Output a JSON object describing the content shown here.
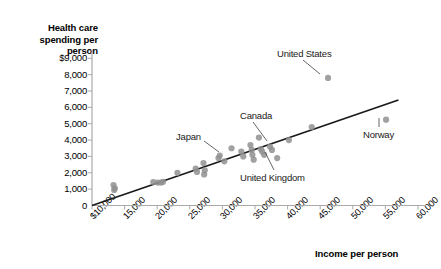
{
  "chart_data": {
    "type": "scatter",
    "title": "",
    "ylabel": "Health care spending per person",
    "xlabel": "Income per person",
    "xlim": [
      10000,
      60000
    ],
    "ylim": [
      0,
      9000
    ],
    "grid": false,
    "legend": null,
    "xticks": [
      "$10,000",
      "15,000",
      "20,000",
      "25,000",
      "30,000",
      "35,000",
      "40,000",
      "45,000",
      "50,000",
      "55,000",
      "60,000"
    ],
    "xtick_values": [
      10000,
      15000,
      20000,
      25000,
      30000,
      35000,
      40000,
      45000,
      50000,
      55000,
      60000
    ],
    "yticks": [
      "0",
      "1,000",
      "2,000",
      "3,000",
      "4,000",
      "5,000",
      "6,000",
      "7,000",
      "8,000",
      "$9,000"
    ],
    "ytick_values": [
      0,
      1000,
      2000,
      3000,
      4000,
      5000,
      6000,
      7000,
      8000,
      9000
    ],
    "marker_color": "#909090",
    "line_color": "#1a1a1a",
    "axis_color": "#aaaaaa",
    "trendline": {
      "x": [
        10000,
        57000
      ],
      "y": [
        0,
        6450
      ]
    },
    "points": [
      {
        "x": 13300,
        "y": 1250
      },
      {
        "x": 13400,
        "y": 950
      },
      {
        "x": 13500,
        "y": 1050
      },
      {
        "x": 19400,
        "y": 1430
      },
      {
        "x": 20100,
        "y": 1400
      },
      {
        "x": 20600,
        "y": 1400
      },
      {
        "x": 20900,
        "y": 1450
      },
      {
        "x": 23100,
        "y": 2000
      },
      {
        "x": 25900,
        "y": 2250
      },
      {
        "x": 26100,
        "y": 2050
      },
      {
        "x": 27100,
        "y": 2600
      },
      {
        "x": 27200,
        "y": 1900
      },
      {
        "x": 27300,
        "y": 2150
      },
      {
        "x": 29400,
        "y": 2900
      },
      {
        "x": 29600,
        "y": 3050
      },
      {
        "x": 30300,
        "y": 2700
      },
      {
        "x": 31400,
        "y": 3500
      },
      {
        "x": 32900,
        "y": 3300
      },
      {
        "x": 33200,
        "y": 3000
      },
      {
        "x": 34300,
        "y": 3700
      },
      {
        "x": 34500,
        "y": 3400
      },
      {
        "x": 34600,
        "y": 3100
      },
      {
        "x": 34800,
        "y": 2800
      },
      {
        "x": 35600,
        "y": 4150
      },
      {
        "x": 35900,
        "y": 3450
      },
      {
        "x": 36100,
        "y": 3300
      },
      {
        "x": 36400,
        "y": 3100
      },
      {
        "x": 37300,
        "y": 3600
      },
      {
        "x": 37600,
        "y": 3400
      },
      {
        "x": 38400,
        "y": 2900
      },
      {
        "x": 40200,
        "y": 4000
      },
      {
        "x": 43700,
        "y": 4800
      },
      {
        "x": 46200,
        "y": 7800
      },
      {
        "x": 55100,
        "y": 5250
      }
    ],
    "annotations": [
      {
        "label": "United States",
        "point": {
          "x": 46200,
          "y": 7800
        },
        "text_px": {
          "x": 277,
          "y": 48
        },
        "leader": {
          "x1": 303,
          "y1": 60,
          "x2": 320,
          "y2": 74
        }
      },
      {
        "label": "Canada",
        "point": {
          "x": 34500,
          "y": 3400
        },
        "text_px": {
          "x": 240,
          "y": 110
        },
        "leader": {
          "x1": 253,
          "y1": 122,
          "x2": 267,
          "y2": 141
        }
      },
      {
        "label": "Japan",
        "point": {
          "x": 30300,
          "y": 2700
        },
        "text_px": {
          "x": 176,
          "y": 131
        },
        "leader": {
          "x1": 204,
          "y1": 141,
          "x2": 219,
          "y2": 152
        }
      },
      {
        "label": "United Kingdom",
        "point": {
          "x": 36400,
          "y": 3100
        },
        "text_px": {
          "x": 240,
          "y": 172
        },
        "leader": {
          "x1": 274,
          "y1": 170,
          "x2": 265,
          "y2": 152
        }
      },
      {
        "label": "Norway",
        "point": {
          "x": 55100,
          "y": 5250
        },
        "text_px": {
          "x": 363,
          "y": 129
        },
        "leader": {
          "x1": 379,
          "y1": 127,
          "x2": 379,
          "y2": 118
        }
      }
    ]
  },
  "axis": {
    "y_title_lines": [
      "Health care",
      "spending per",
      "person"
    ],
    "x_title": "Income per person"
  }
}
